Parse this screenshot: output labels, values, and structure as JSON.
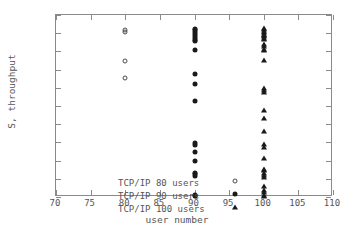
{
  "chart_data": {
    "type": "scatter",
    "title": "",
    "xlabel": "user number",
    "ylabel": "S, throughput",
    "xlim": [
      70,
      110
    ],
    "ylim": [
      0,
      1
    ],
    "xticks": [
      70,
      75,
      80,
      85,
      90,
      95,
      100,
      105,
      110
    ],
    "yticks": [
      "0",
      "0.1",
      "0.2",
      "0.3",
      "0.4",
      "0.5",
      "0.6",
      "0.7",
      "0.8",
      "0.9",
      "1"
    ],
    "grid": false,
    "legend_position": "lower left",
    "series": [
      {
        "name": "TCP/IP 80 users",
        "marker": "circle-open",
        "x": [
          80,
          80,
          80,
          80
        ],
        "y": [
          0.915,
          0.905,
          0.745,
          0.655
        ]
      },
      {
        "name": "TCP/IP 90 users",
        "marker": "circle-filled",
        "x": [
          90,
          90,
          90,
          90,
          90,
          90,
          90,
          90,
          90,
          90,
          90,
          90,
          90,
          90,
          90,
          90,
          90,
          90,
          90,
          90,
          90
        ],
        "y": [
          0.925,
          0.915,
          0.905,
          0.895,
          0.885,
          0.875,
          0.865,
          0.855,
          0.81,
          0.675,
          0.62,
          0.53,
          0.295,
          0.285,
          0.248,
          0.2,
          0.133,
          0.125,
          0.118,
          0.012,
          0.006
        ]
      },
      {
        "name": "TCP/IP 100 users",
        "marker": "triangle-filled",
        "x": [
          100,
          100,
          100,
          100,
          100,
          100,
          100,
          100,
          100,
          100,
          100,
          100,
          100,
          100,
          100,
          100,
          100,
          100,
          100,
          100,
          100,
          100,
          100,
          100,
          100,
          100,
          100,
          100,
          100,
          100,
          100,
          100,
          100
        ],
        "y": [
          0.93,
          0.922,
          0.914,
          0.906,
          0.898,
          0.89,
          0.882,
          0.874,
          0.866,
          0.84,
          0.828,
          0.812,
          0.805,
          0.755,
          0.6,
          0.588,
          0.578,
          0.48,
          0.435,
          0.36,
          0.29,
          0.272,
          0.215,
          0.155,
          0.148,
          0.13,
          0.12,
          0.112,
          0.06,
          0.04,
          0.025,
          0.012,
          0.004
        ]
      }
    ]
  },
  "legend": {
    "entries": [
      {
        "label": "TCP/IP 80 users",
        "marker": "circle-open"
      },
      {
        "label": "TCP/IP 90 users",
        "marker": "circle-filled"
      },
      {
        "label": "TCP/IP 100 users",
        "marker": "triangle-filled"
      }
    ]
  },
  "colors": {
    "frame": "#8a8a8a",
    "text": "#555555",
    "marker_fill": "#1a1a1a",
    "marker_stroke": "#4a4a4a",
    "background": "#ffffff"
  }
}
